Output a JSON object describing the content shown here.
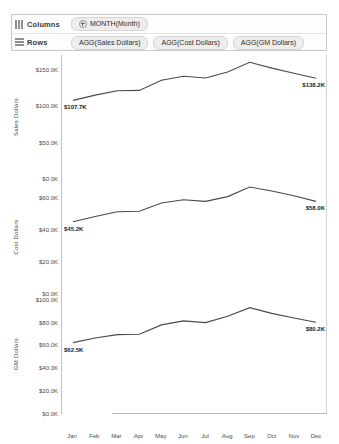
{
  "shelves": {
    "columns": {
      "label": "Columns",
      "icon": "columns-icon",
      "pills": [
        {
          "text": "MONTH(Month)",
          "has_expand": true
        }
      ]
    },
    "rows": {
      "label": "Rows",
      "icon": "rows-icon",
      "pills": [
        {
          "text": "AGG(Sales Dollars)",
          "has_expand": false
        },
        {
          "text": "AGG(Cost Dollars)",
          "has_expand": false
        },
        {
          "text": "AGG(GM Dollars)",
          "has_expand": false
        }
      ]
    }
  },
  "chart_data": [
    {
      "type": "line",
      "title": "",
      "ylabel": "Sales Dollars",
      "xlabel": "",
      "categories": [
        "Jan",
        "Feb",
        "Mar",
        "Apr",
        "May",
        "Jun",
        "Jul",
        "Aug",
        "Sep",
        "Oct",
        "Nov",
        "Dec"
      ],
      "values": [
        107.7,
        115.0,
        121.0,
        121.5,
        135.5,
        141.0,
        138.5,
        146.5,
        160.0,
        152.0,
        145.0,
        138.2
      ],
      "unit": "K",
      "ylim": [
        0,
        170
      ],
      "yticks": [
        0,
        50,
        100,
        150
      ],
      "ytick_labels": [
        "$0.0K",
        "$50.0K",
        "$100.0K",
        "$150.0K"
      ],
      "grid": false,
      "endpoint_labels": [
        {
          "index": 0,
          "text": "$107.7K"
        },
        {
          "index": 11,
          "text": "$138.2K"
        }
      ]
    },
    {
      "type": "line",
      "title": "",
      "ylabel": "Cost Dollars",
      "xlabel": "",
      "categories": [
        "Jan",
        "Feb",
        "Mar",
        "Apr",
        "May",
        "Jun",
        "Jul",
        "Aug",
        "Sep",
        "Oct",
        "Nov",
        "Dec"
      ],
      "values": [
        45.2,
        48.5,
        51.5,
        51.8,
        57.0,
        59.0,
        58.0,
        61.0,
        67.0,
        64.5,
        61.5,
        58.0
      ],
      "unit": "K",
      "ylim": [
        0,
        72
      ],
      "yticks": [
        0,
        20,
        40,
        60
      ],
      "ytick_labels": [
        "$0.0K",
        "$20.0K",
        "$40.0K",
        "$60.0K"
      ],
      "grid": false,
      "endpoint_labels": [
        {
          "index": 0,
          "text": "$45.2K"
        },
        {
          "index": 11,
          "text": "$58.0K"
        }
      ]
    },
    {
      "type": "line",
      "title": "",
      "ylabel": "GM Dollars",
      "xlabel": "",
      "categories": [
        "Jan",
        "Feb",
        "Mar",
        "Apr",
        "May",
        "Jun",
        "Jul",
        "Aug",
        "Sep",
        "Oct",
        "Nov",
        "Dec"
      ],
      "values": [
        62.5,
        66.5,
        69.5,
        69.8,
        78.0,
        81.5,
        80.0,
        85.5,
        93.0,
        88.0,
        84.0,
        80.2
      ],
      "unit": "K",
      "ylim": [
        0,
        105
      ],
      "yticks": [
        0,
        20,
        40,
        60,
        80,
        100
      ],
      "ytick_labels": [
        "$0.0K",
        "$20.0K",
        "$40.0K",
        "$60.0K",
        "$80.0K",
        "$100.0K"
      ],
      "grid": false,
      "endpoint_labels": [
        {
          "index": 0,
          "text": "$62.5K"
        },
        {
          "index": 11,
          "text": "$80.2K"
        }
      ]
    }
  ],
  "axis": {
    "months": [
      "Jan",
      "Feb",
      "Mar",
      "Apr",
      "May",
      "Jun",
      "Jul",
      "Aug",
      "Sep",
      "Oct",
      "Nov",
      "Dec"
    ]
  },
  "colors": {
    "line": "#4a4a4a",
    "axis": "#b9b9b9",
    "text": "#4a4a4a",
    "pill": "#ededed"
  }
}
